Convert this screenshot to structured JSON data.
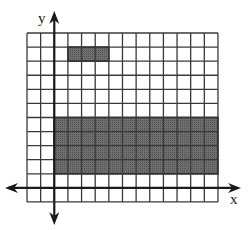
{
  "diagram": {
    "type": "coordinate-grid",
    "grid": {
      "columns": 14,
      "rows": 12,
      "left": 27,
      "top": 33,
      "cell_w": 13.64,
      "cell_h": 14.08
    },
    "axes": {
      "x_label": "x",
      "y_label": "y",
      "y_axis_column": 2,
      "x_axis_row": 11
    },
    "shaded_regions": [
      {
        "name": "small-rectangle",
        "col_start": 3,
        "col_end": 6,
        "row_start": 1,
        "row_end": 2
      },
      {
        "name": "large-rectangle",
        "col_start": 2,
        "col_end": 14,
        "row_start": 6,
        "row_end": 10
      }
    ],
    "colors": {
      "grid": "#3a3a3a",
      "fill": "#6b6b6b",
      "axis": "#1a1a1a",
      "background": "#ffffff"
    }
  }
}
